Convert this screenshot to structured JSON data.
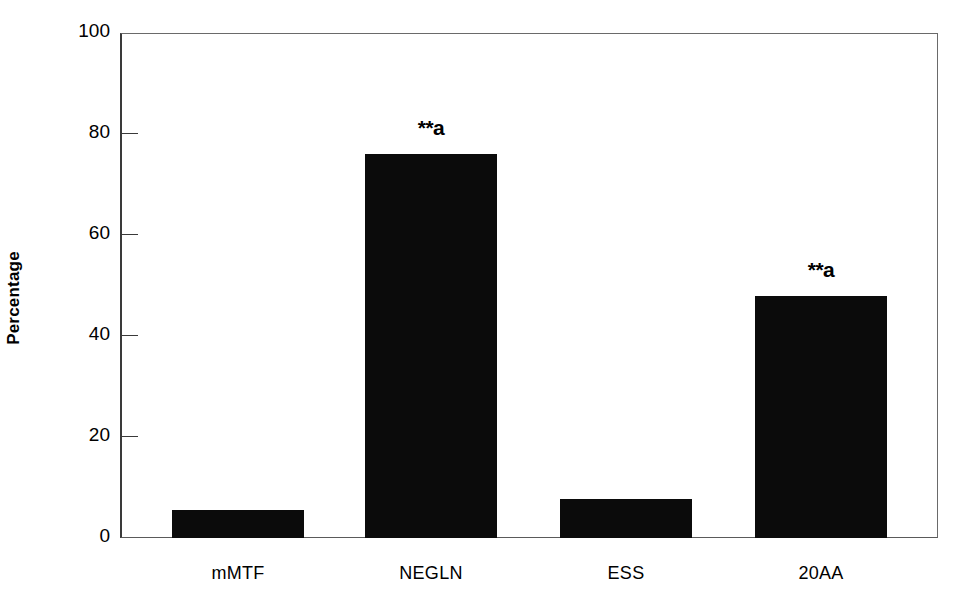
{
  "chart_data": {
    "type": "bar",
    "title": "",
    "subtitle": "",
    "xlabel": "",
    "ylabel": "Percentage",
    "categories": [
      "mMTF",
      "NEGLN",
      "ESS",
      "20AA"
    ],
    "values": [
      5.5,
      76,
      7.7,
      48
    ],
    "annotations": [
      "",
      "**a",
      "",
      "**a"
    ],
    "ylim": [
      0,
      100
    ],
    "yticks": [
      0,
      20,
      40,
      60,
      80,
      100
    ],
    "ytick_labels": [
      "0",
      "20",
      "40",
      "60",
      "80",
      "100"
    ],
    "grid": false,
    "legend": false,
    "legend_position": "none",
    "bar_color": "#0b0b0b",
    "axis_color": "#3a3a3a",
    "background_color": "#ffffff"
  },
  "axes": {
    "y_title": "Percentage"
  }
}
